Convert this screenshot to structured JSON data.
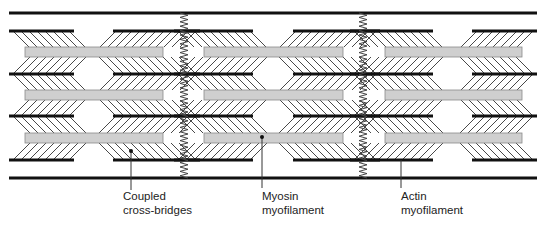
{
  "diagram": {
    "colors": {
      "line": "#111111",
      "myosin_fill": "#cfcfcf",
      "myosin_border": "#8a8a8a",
      "hatch": "#333333",
      "spring": "#444444"
    },
    "boundary_lines_y": [
      13,
      178
    ],
    "springs_x": [
      184,
      363
    ],
    "actin_rows_y": [
      31,
      74,
      116,
      160
    ],
    "myosin_rows_y": [
      47,
      90,
      133
    ],
    "myosin_height": 10,
    "segments": [
      {
        "myosin_x": [
          25,
          163
        ],
        "actin_left": [
          9,
          74
        ],
        "actin_right": [
          113,
          200
        ]
      },
      {
        "myosin_x": [
          204,
          343
        ],
        "actin_left": [
          174,
          253
        ],
        "actin_right": [
          293,
          380
        ]
      },
      {
        "myosin_x": [
          385,
          522
        ],
        "actin_left": [
          350,
          433
        ],
        "actin_right": [
          472,
          537
        ]
      }
    ]
  },
  "labels": {
    "cross_bridges": {
      "line1": "Coupled",
      "line2": "cross-bridges"
    },
    "myosin": {
      "line1": "Myosin",
      "line2": "myofilament"
    },
    "actin": {
      "line1": "Actin",
      "line2": "myofilament"
    }
  }
}
